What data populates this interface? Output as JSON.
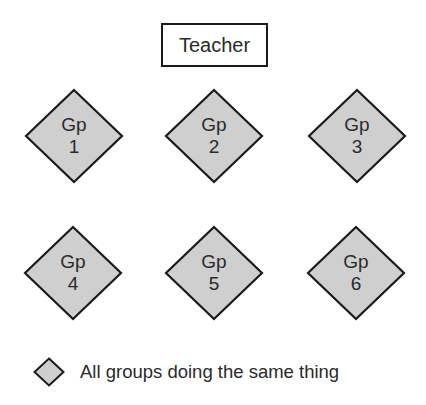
{
  "diagram": {
    "teacher": {
      "label": "Teacher"
    },
    "groups": [
      {
        "line1": "Gp",
        "line2": "1"
      },
      {
        "line1": "Gp",
        "line2": "2"
      },
      {
        "line1": "Gp",
        "line2": "3"
      },
      {
        "line1": "Gp",
        "line2": "4"
      },
      {
        "line1": "Gp",
        "line2": "5"
      },
      {
        "line1": "Gp",
        "line2": "6"
      }
    ],
    "legend": {
      "icon": "diamond-icon",
      "label": "All groups doing the same thing"
    },
    "colors": {
      "diamond_fill": "#cfcfcf",
      "stroke": "#1a1a1a",
      "text": "#2a2a2a",
      "background": "#ffffff"
    }
  }
}
